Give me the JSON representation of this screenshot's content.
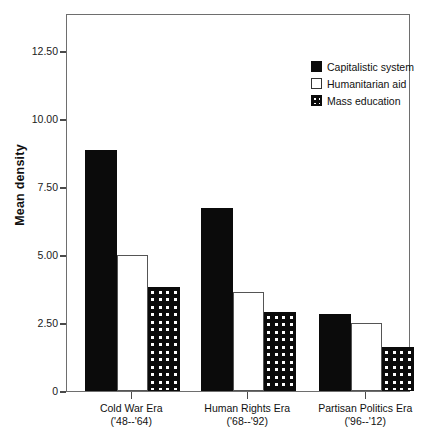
{
  "chart_data": {
    "type": "bar",
    "title": "",
    "xlabel": "",
    "ylabel": "Mean density",
    "ylim": [
      0,
      13.9
    ],
    "grid": false,
    "legend_position": "top-right",
    "categories": [
      "Cold War Era",
      "Human Rights Era",
      "Partisan Politics Era"
    ],
    "category_sublabels": [
      "('48--'64)",
      "('68--'92)",
      "('96--'12)"
    ],
    "y_ticks": [
      "0",
      "2.50",
      "5.00",
      "7.50",
      "10.00",
      "12.50"
    ],
    "y_tick_values": [
      0,
      2.5,
      5.0,
      7.5,
      10.0,
      12.5
    ],
    "series": [
      {
        "name": "Capitalistic system",
        "fill": "solid-black",
        "values": [
          8.86,
          6.72,
          2.85
        ]
      },
      {
        "name": "Humanitarian aid",
        "fill": "open-white",
        "values": [
          5.0,
          3.65,
          2.5
        ]
      },
      {
        "name": "Mass education",
        "fill": "checkered",
        "values": [
          3.84,
          2.91,
          1.61
        ]
      }
    ]
  },
  "legend": {
    "items": [
      {
        "label": "Capitalistic system",
        "swatch": "solid-black-swatch"
      },
      {
        "label": "Humanitarian aid",
        "swatch": "open-white-swatch"
      },
      {
        "label": "Mass education",
        "swatch": "checkered-swatch"
      }
    ]
  },
  "colors": {
    "bar_black": "#0b0b0b",
    "bar_white": "#ffffff",
    "frame": "#6e6e6e",
    "text": "#111111"
  }
}
